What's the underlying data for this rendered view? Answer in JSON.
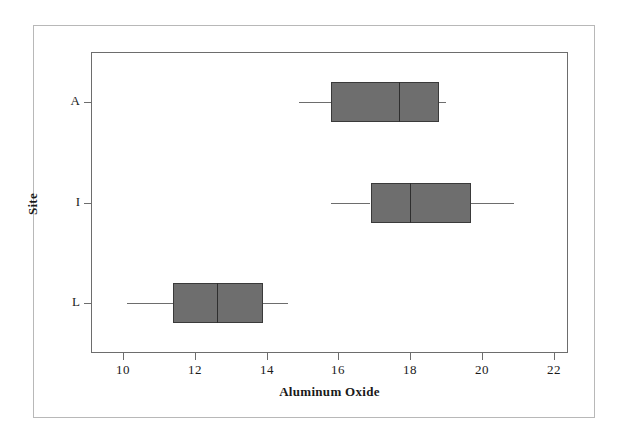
{
  "chart_data": {
    "type": "box",
    "title": "",
    "xlabel": "Aluminum Oxide",
    "ylabel": "Site",
    "orientation": "horizontal",
    "xlim": [
      9.1,
      22.4
    ],
    "xticks": [
      10,
      12,
      14,
      16,
      18,
      20,
      22
    ],
    "xtick_labels": [
      "10",
      "12",
      "14",
      "16",
      "18",
      "20",
      "22"
    ],
    "categories": [
      "A",
      "I",
      "L"
    ],
    "grid": false,
    "legend": null,
    "boxes": [
      {
        "category": "A",
        "whisker_low": 14.9,
        "q1": 15.8,
        "median": 17.7,
        "q3": 18.8,
        "whisker_high": 19.0
      },
      {
        "category": "I",
        "whisker_low": 15.8,
        "q1": 16.9,
        "median": 18.0,
        "q3": 19.7,
        "whisker_high": 20.9
      },
      {
        "category": "L",
        "whisker_low": 10.1,
        "q1": 11.4,
        "median": 12.6,
        "q3": 13.9,
        "whisker_high": 14.6
      }
    ]
  },
  "style": {
    "box_fill": "#6e6e6e",
    "box_edge": "#3a3a3a",
    "axis_color": "#6d6d6d",
    "frame_color": "#b8b8b8",
    "background": "#ffffff",
    "text_color": "#1a1a1a"
  },
  "axis": {
    "x_title": "Aluminum Oxide",
    "y_title": "Site",
    "x_tick_labels": [
      "10",
      "12",
      "14",
      "16",
      "18",
      "20",
      "22"
    ],
    "y_tick_labels": [
      "A",
      "I",
      "L"
    ]
  }
}
